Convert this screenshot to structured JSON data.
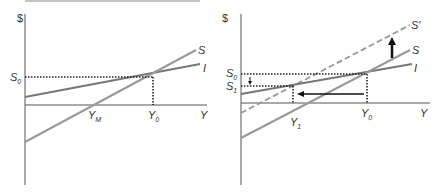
{
  "panels": [
    {
      "id": "left",
      "y_axis_label": "$",
      "x_axis_label": "Y",
      "curves": {
        "S": "S",
        "I": "I"
      },
      "levels": {
        "S0": {
          "base": "S",
          "sub": "0"
        }
      },
      "ticks": {
        "YM": {
          "base": "Y",
          "sub": "M"
        },
        "Y0": {
          "base": "Y",
          "sub": "0"
        }
      }
    },
    {
      "id": "right",
      "y_axis_label": "$",
      "x_axis_label": "Y",
      "curves": {
        "S_prime": "S'",
        "S": "S",
        "I": "I"
      },
      "levels": {
        "S0": {
          "base": "S",
          "sub": "0"
        },
        "S1": {
          "base": "S",
          "sub": "1"
        }
      },
      "ticks": {
        "Y1": {
          "base": "Y",
          "sub": "1"
        },
        "Y0": {
          "base": "Y",
          "sub": "0"
        }
      }
    }
  ],
  "colors": {
    "axis": "#555555",
    "saving_line": "#999999",
    "investment_line": "#777777",
    "dotted": "#222222",
    "arrow": "#111111"
  }
}
